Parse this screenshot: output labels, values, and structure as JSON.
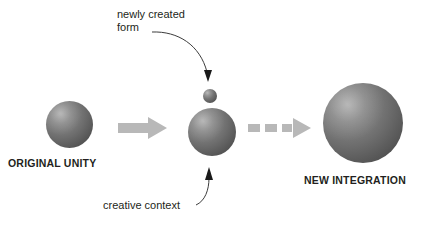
{
  "diagram": {
    "background_color": "#ffffff",
    "sphere_color_light": "#8a8a8a",
    "sphere_color_dark": "#4a4a4a",
    "arrow_color": "#b8b8b8",
    "leader_color": "#3c3c3c",
    "text_color": "#231f20"
  },
  "labels": {
    "original_unity": "ORIGINAL UNITY",
    "new_integration": "NEW INTEGRATION",
    "newly_created_form_line1": "newly created",
    "newly_created_form_line2": "form",
    "creative_context": "creative context"
  },
  "nodes": [
    {
      "name": "original-unity-sphere",
      "size": "large",
      "x": 46,
      "y": 101,
      "diameter": 47
    },
    {
      "name": "newly-created-form-sphere",
      "size": "small",
      "x": 203,
      "y": 89,
      "diameter": 14
    },
    {
      "name": "creative-context-sphere",
      "size": "medium",
      "x": 188,
      "y": 108,
      "diameter": 48
    },
    {
      "name": "new-integration-sphere",
      "size": "xlarge",
      "x": 323,
      "y": 83,
      "diameter": 80
    }
  ],
  "connectors": [
    {
      "name": "solid-arrow",
      "style": "solid",
      "from": "original-unity",
      "to": "creative-context"
    },
    {
      "name": "dashed-arrow",
      "style": "dashed",
      "from": "creative-context",
      "to": "new-integration"
    },
    {
      "name": "newly-created-form-leader",
      "style": "curved-thin",
      "points_to": "newly-created-form-sphere"
    },
    {
      "name": "creative-context-leader",
      "style": "curved-thin",
      "points_to": "creative-context-sphere"
    }
  ]
}
